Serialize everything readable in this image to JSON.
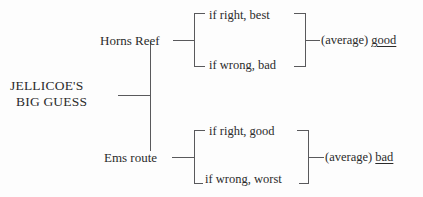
{
  "diagram": {
    "type": "bracket-tree",
    "title_text": "JELLICOE'S BIG GUESS",
    "root": {
      "line1": "JELLICOE'S",
      "line2": "BIG GUESS"
    },
    "branches": [
      {
        "id": "horns-reef",
        "label": "Horns Reef",
        "outcomes": [
          {
            "id": "horns-reef-if-right",
            "label": "if right, best"
          },
          {
            "id": "horns-reef-if-wrong",
            "label": "if wrong, bad"
          }
        ],
        "summary": {
          "prefix": "(average)",
          "verdict": "bad_or_good_placeholder",
          "value": "good"
        }
      },
      {
        "id": "ems-route",
        "label": "Ems route",
        "outcomes": [
          {
            "id": "ems-route-if-right",
            "label": "if right, good"
          },
          {
            "id": "ems-route-if-wrong",
            "label": "if wrong, worst"
          }
        ],
        "summary": {
          "prefix": "(average)",
          "verdict": "bad_or_good_placeholder",
          "value": "bad"
        }
      }
    ],
    "colors": {
      "background": "#fdfdfd",
      "line": "#59595c",
      "text": "#2b2b2b"
    }
  }
}
